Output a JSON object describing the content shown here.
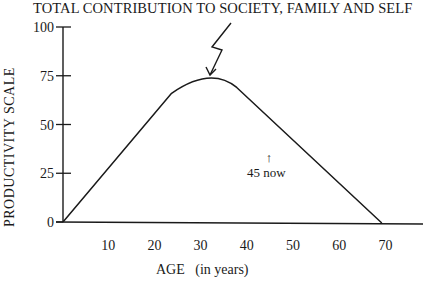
{
  "chart_data": {
    "type": "line",
    "title": "TOTAL CONTRIBUTION TO SOCIETY, FAMILY AND SELF",
    "xlabel": "AGE   (in years)",
    "ylabel": "PRODUCTIVITY SCALE",
    "x_ticks": [
      10,
      20,
      30,
      40,
      50,
      60,
      70
    ],
    "y_ticks": [
      0,
      25,
      50,
      75,
      100
    ],
    "xlim": [
      0,
      77
    ],
    "ylim": [
      0,
      100
    ],
    "grid": false,
    "legend": null,
    "series": [
      {
        "name": "Productivity",
        "x": [
          0,
          10,
          20,
          23.5,
          28,
          32,
          36,
          37.6,
          45,
          50,
          60,
          69
        ],
        "y": [
          0,
          27,
          54,
          66,
          73,
          75,
          72,
          69,
          52,
          41,
          20,
          0
        ]
      }
    ],
    "annotations": [
      {
        "text": "45 now",
        "x": 45,
        "y": 31,
        "arrow": "up"
      },
      {
        "text": "TOTAL CONTRIBUTION TO SOCIETY, FAMILY AND SELF",
        "points_to": {
          "x": 32,
          "y": 75
        },
        "arrow": "zigzag"
      }
    ]
  },
  "labels": {
    "title": "TOTAL CONTRIBUTION TO SOCIETY, FAMILY AND SELF",
    "ylabel": "PRODUCTIVITY SCALE",
    "xlabel": "AGE   (in years)",
    "annotation": "45 now",
    "annotation_arrow": "↑",
    "y_ticks": [
      "0",
      "25",
      "50",
      "75",
      "100"
    ],
    "x_ticks": [
      "10",
      "20",
      "30",
      "40",
      "50",
      "60",
      "70"
    ]
  }
}
